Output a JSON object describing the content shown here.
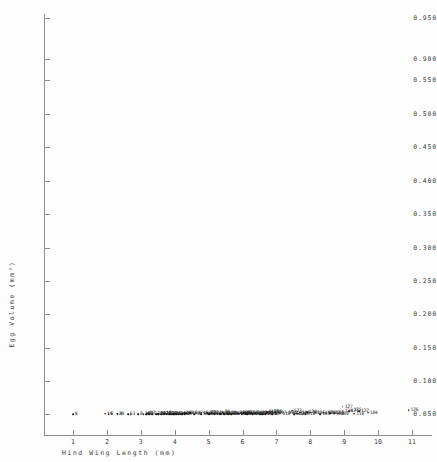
{
  "chart_data": {
    "type": "scatter",
    "title": "",
    "xlabel": "Hind Wing Length (mm)",
    "ylabel": "Egg Volume (mm³)",
    "xlim": [
      0.5,
      11.8
    ],
    "ylim": [
      0.0,
      0.975
    ],
    "grid": false,
    "legend": null,
    "marker": "dot-with-numeric-label",
    "xticks": [
      1,
      2,
      3,
      4,
      5,
      6,
      7,
      8,
      9,
      10,
      11
    ],
    "xtick_labels": [
      "1",
      "2",
      "3",
      "4",
      "5",
      "6",
      "7",
      "8",
      "9",
      "10",
      "11"
    ],
    "yticks": [
      0.05,
      0.1,
      0.15,
      0.2,
      0.25,
      0.3,
      0.35,
      0.4,
      0.45,
      0.5,
      0.55,
      0.9,
      0.95
    ],
    "ytick_labels": [
      "0.050",
      "0.100",
      "0.150",
      "0.200",
      "0.250",
      "0.300",
      "0.350",
      "0.400",
      "0.450",
      "0.500",
      "0.550",
      "0.900",
      "0.950"
    ],
    "points": [
      {
        "label": "9",
        "x": 1.0,
        "y": 0.036
      },
      {
        "label": "6",
        "x": 2.05,
        "y": 0.021
      },
      {
        "label": "4",
        "x": 2.32,
        "y": 0.018
      },
      {
        "label": "5",
        "x": 2.62,
        "y": 0.016
      },
      {
        "label": "3",
        "x": 2.7,
        "y": 0.02
      },
      {
        "label": "8",
        "x": 2.92,
        "y": 0.022
      },
      {
        "label": "12",
        "x": 3.08,
        "y": 0.029
      },
      {
        "label": "7",
        "x": 3.16,
        "y": 0.018
      },
      {
        "label": "2",
        "x": 3.24,
        "y": 0.024
      },
      {
        "label": "11",
        "x": 3.95,
        "y": 0.028
      },
      {
        "label": "10",
        "x": 4.2,
        "y": 0.019
      },
      {
        "label": "20",
        "x": 2.3,
        "y": 0.102
      },
      {
        "label": "19",
        "x": 1.95,
        "y": 0.072
      },
      {
        "label": "31",
        "x": 3.18,
        "y": 0.046
      },
      {
        "label": "33",
        "x": 3.34,
        "y": 0.049
      },
      {
        "label": "30",
        "x": 3.46,
        "y": 0.04
      },
      {
        "label": "38",
        "x": 3.52,
        "y": 0.043
      },
      {
        "label": "37",
        "x": 3.6,
        "y": 0.038
      },
      {
        "label": "35",
        "x": 3.68,
        "y": 0.046
      },
      {
        "label": "39",
        "x": 3.76,
        "y": 0.036
      },
      {
        "label": "36",
        "x": 3.84,
        "y": 0.042
      },
      {
        "label": "34",
        "x": 3.9,
        "y": 0.033
      },
      {
        "label": "32",
        "x": 3.98,
        "y": 0.05
      },
      {
        "label": "41",
        "x": 4.04,
        "y": 0.03
      },
      {
        "label": "42",
        "x": 4.12,
        "y": 0.057
      },
      {
        "label": "43",
        "x": 4.22,
        "y": 0.044
      },
      {
        "label": "40",
        "x": 4.3,
        "y": 0.038
      },
      {
        "label": "29",
        "x": 3.52,
        "y": 0.073
      },
      {
        "label": "26",
        "x": 3.68,
        "y": 0.08
      },
      {
        "label": "27",
        "x": 3.78,
        "y": 0.07
      },
      {
        "label": "28",
        "x": 3.86,
        "y": 0.063
      },
      {
        "label": "25",
        "x": 3.98,
        "y": 0.068
      },
      {
        "label": "24",
        "x": 4.1,
        "y": 0.074
      },
      {
        "label": "18",
        "x": 3.7,
        "y": 0.118
      },
      {
        "label": "17",
        "x": 3.22,
        "y": 0.136
      },
      {
        "label": "16",
        "x": 4.28,
        "y": 0.126
      },
      {
        "label": "15",
        "x": 3.52,
        "y": 0.096
      },
      {
        "label": "14",
        "x": 3.06,
        "y": 0.1
      },
      {
        "label": "50",
        "x": 4.58,
        "y": 0.06
      },
      {
        "label": "51",
        "x": 4.78,
        "y": 0.057
      },
      {
        "label": "52",
        "x": 4.9,
        "y": 0.067
      },
      {
        "label": "53",
        "x": 5.02,
        "y": 0.071
      },
      {
        "label": "54",
        "x": 5.14,
        "y": 0.064
      },
      {
        "label": "55",
        "x": 5.26,
        "y": 0.08
      },
      {
        "label": "56",
        "x": 5.38,
        "y": 0.076
      },
      {
        "label": "57",
        "x": 5.5,
        "y": 0.085
      },
      {
        "label": "58",
        "x": 5.62,
        "y": 0.091
      },
      {
        "label": "59",
        "x": 5.7,
        "y": 0.078
      },
      {
        "label": "60",
        "x": 5.8,
        "y": 0.096
      },
      {
        "label": "61",
        "x": 5.9,
        "y": 0.088
      },
      {
        "label": "62",
        "x": 6.0,
        "y": 0.082
      },
      {
        "label": "63",
        "x": 6.1,
        "y": 0.094
      },
      {
        "label": "64",
        "x": 6.22,
        "y": 0.087
      },
      {
        "label": "65",
        "x": 5.46,
        "y": 0.052
      },
      {
        "label": "66",
        "x": 5.58,
        "y": 0.046
      },
      {
        "label": "67",
        "x": 5.02,
        "y": 0.04
      },
      {
        "label": "68",
        "x": 5.18,
        "y": 0.033
      },
      {
        "label": "69",
        "x": 5.34,
        "y": 0.027
      },
      {
        "label": "70",
        "x": 5.66,
        "y": 0.034
      },
      {
        "label": "21",
        "x": 4.96,
        "y": 0.157
      },
      {
        "label": "22",
        "x": 5.02,
        "y": 0.166
      },
      {
        "label": "23",
        "x": 5.08,
        "y": 0.173
      },
      {
        "label": "13",
        "x": 5.18,
        "y": 0.15
      },
      {
        "label": "45",
        "x": 5.44,
        "y": 0.178
      },
      {
        "label": "46",
        "x": 4.78,
        "y": 0.186
      },
      {
        "label": "47",
        "x": 4.62,
        "y": 0.148
      },
      {
        "label": "48",
        "x": 4.46,
        "y": 0.13
      },
      {
        "label": "49",
        "x": 4.34,
        "y": 0.112
      },
      {
        "label": "71",
        "x": 6.34,
        "y": 0.104
      },
      {
        "label": "72",
        "x": 6.46,
        "y": 0.098
      },
      {
        "label": "73",
        "x": 6.58,
        "y": 0.11
      },
      {
        "label": "74",
        "x": 6.7,
        "y": 0.118
      },
      {
        "label": "75",
        "x": 6.82,
        "y": 0.106
      },
      {
        "label": "76",
        "x": 6.46,
        "y": 0.064
      },
      {
        "label": "77",
        "x": 6.58,
        "y": 0.058
      },
      {
        "label": "78",
        "x": 6.68,
        "y": 0.06
      },
      {
        "label": "79",
        "x": 6.78,
        "y": 0.063
      },
      {
        "label": "80",
        "x": 6.88,
        "y": 0.057
      },
      {
        "label": "81",
        "x": 6.3,
        "y": 0.036
      },
      {
        "label": "82",
        "x": 6.52,
        "y": 0.031
      },
      {
        "label": "83",
        "x": 5.98,
        "y": 0.026
      },
      {
        "label": "84",
        "x": 6.14,
        "y": 0.022
      },
      {
        "label": "85",
        "x": 5.86,
        "y": 0.126
      },
      {
        "label": "86",
        "x": 6.02,
        "y": 0.139
      },
      {
        "label": "87",
        "x": 6.14,
        "y": 0.134
      },
      {
        "label": "88",
        "x": 6.26,
        "y": 0.145
      },
      {
        "label": "89",
        "x": 6.38,
        "y": 0.152
      },
      {
        "label": "90",
        "x": 5.62,
        "y": 0.117
      },
      {
        "label": "91",
        "x": 6.72,
        "y": 0.205
      },
      {
        "label": "92",
        "x": 6.52,
        "y": 0.192
      },
      {
        "label": "93",
        "x": 6.08,
        "y": 0.176
      },
      {
        "label": "94",
        "x": 5.96,
        "y": 0.21
      },
      {
        "label": "95",
        "x": 5.42,
        "y": 0.238
      },
      {
        "label": "96",
        "x": 6.96,
        "y": 0.244
      },
      {
        "label": "97",
        "x": 7.08,
        "y": 0.226
      },
      {
        "label": "98",
        "x": 7.42,
        "y": 0.218
      },
      {
        "label": "99",
        "x": 7.3,
        "y": 0.196
      },
      {
        "label": "100",
        "x": 7.7,
        "y": 0.213
      },
      {
        "label": "101",
        "x": 8.0,
        "y": 0.224
      },
      {
        "label": "102",
        "x": 8.38,
        "y": 0.212
      },
      {
        "label": "103",
        "x": 8.7,
        "y": 0.211
      },
      {
        "label": "104",
        "x": 9.7,
        "y": 0.206
      },
      {
        "label": "105",
        "x": 8.14,
        "y": 0.188
      },
      {
        "label": "106",
        "x": 8.46,
        "y": 0.156
      },
      {
        "label": "107",
        "x": 8.58,
        "y": 0.128
      },
      {
        "label": "108",
        "x": 8.7,
        "y": 0.09
      },
      {
        "label": "109",
        "x": 8.84,
        "y": 0.068
      },
      {
        "label": "110",
        "x": 9.3,
        "y": 0.085
      },
      {
        "label": "111",
        "x": 8.3,
        "y": 0.058
      },
      {
        "label": "112",
        "x": 7.86,
        "y": 0.06
      },
      {
        "label": "113",
        "x": 7.52,
        "y": 0.045
      },
      {
        "label": "114",
        "x": 7.58,
        "y": 0.085
      },
      {
        "label": "115",
        "x": 7.64,
        "y": 0.098
      },
      {
        "label": "116",
        "x": 7.12,
        "y": 0.072
      },
      {
        "label": "117",
        "x": 6.72,
        "y": 0.296
      },
      {
        "label": "118",
        "x": 6.78,
        "y": 0.308
      },
      {
        "label": "119",
        "x": 6.86,
        "y": 0.352
      },
      {
        "label": "120",
        "x": 7.9,
        "y": 0.3
      },
      {
        "label": "121",
        "x": 9.14,
        "y": 0.358
      },
      {
        "label": "122",
        "x": 9.44,
        "y": 0.364
      },
      {
        "label": "123",
        "x": 7.46,
        "y": 0.44
      },
      {
        "label": "124",
        "x": 8.96,
        "y": 0.443
      },
      {
        "label": "125",
        "x": 9.22,
        "y": 0.568
      },
      {
        "label": "126",
        "x": 10.9,
        "y": 0.521
      },
      {
        "label": "127",
        "x": 8.96,
        "y": 0.938
      }
    ]
  }
}
